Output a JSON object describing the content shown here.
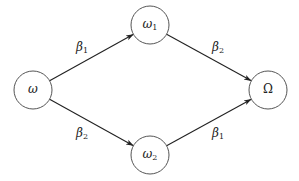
{
  "diagram": {
    "type": "directed-graph",
    "nodes": [
      {
        "id": "omega",
        "symbol": "ω",
        "subscript": "",
        "cx": 33,
        "cy": 90,
        "r": 19
      },
      {
        "id": "omega1",
        "symbol": "ω",
        "subscript": "1",
        "cx": 150,
        "cy": 25,
        "r": 19
      },
      {
        "id": "omega2",
        "symbol": "ω",
        "subscript": "2",
        "cx": 150,
        "cy": 155,
        "r": 19
      },
      {
        "id": "Omega",
        "symbol": "Ω",
        "subscript": "",
        "cx": 268,
        "cy": 90,
        "r": 19
      }
    ],
    "edges": [
      {
        "from": "omega",
        "to": "omega1",
        "symbol": "β",
        "subscript": "1",
        "label_x": 82,
        "label_y": 48
      },
      {
        "from": "omega",
        "to": "omega2",
        "symbol": "β",
        "subscript": "2",
        "label_x": 82,
        "label_y": 134
      },
      {
        "from": "omega1",
        "to": "Omega",
        "symbol": "β",
        "subscript": "2",
        "label_x": 218,
        "label_y": 48
      },
      {
        "from": "omega2",
        "to": "Omega",
        "symbol": "β",
        "subscript": "1",
        "label_x": 218,
        "label_y": 134
      }
    ]
  },
  "colors": {
    "background": "#ffffff",
    "node_stroke": "#555555",
    "edge_stroke": "#222222",
    "text": "#222222"
  }
}
